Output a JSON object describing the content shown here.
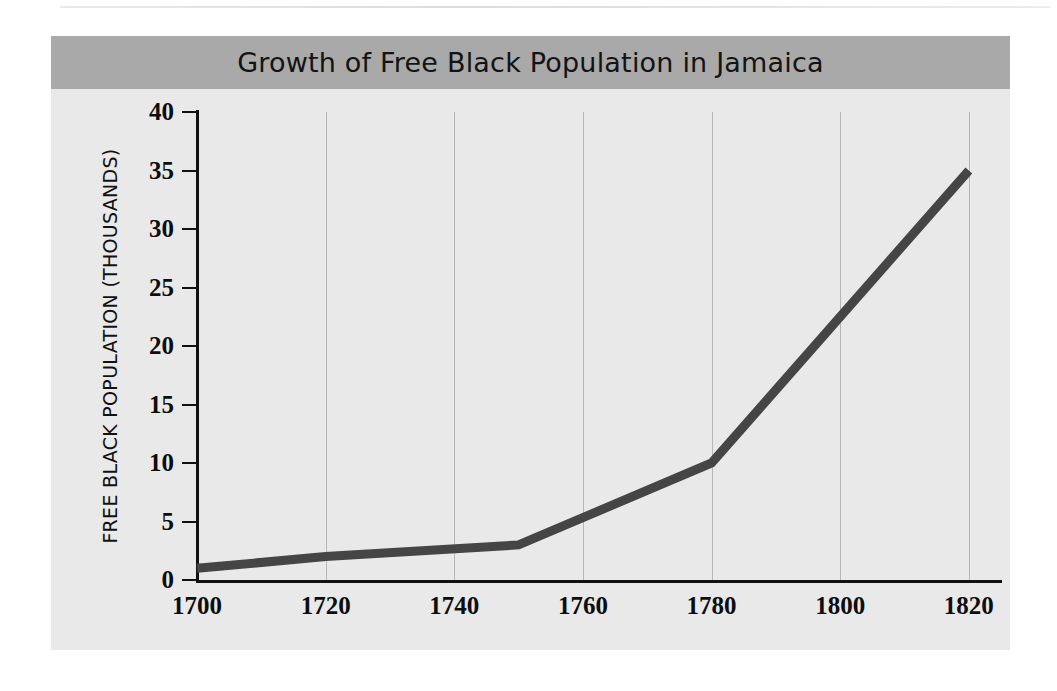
{
  "page": {
    "background_color": "#ffffff",
    "rule_color": "#e0e0e0"
  },
  "figure": {
    "background_color": "#e9e9e9",
    "banner_color": "#a9a9a9",
    "line_color": "#454545",
    "grid_color": "#b6b6b6",
    "axis_color": "#111111"
  },
  "chart_data": {
    "type": "line",
    "title": "Growth of Free Black Population in Jamaica",
    "xlabel": "",
    "ylabel": "FREE BLACK POPULATION (THOUSANDS)",
    "x": [
      1700,
      1720,
      1750,
      1780,
      1820
    ],
    "values": [
      1,
      2,
      3,
      10,
      35
    ],
    "series": [
      {
        "name": "Free Black Population",
        "points": [
          {
            "x": 1700,
            "y": 1
          },
          {
            "x": 1720,
            "y": 2
          },
          {
            "x": 1750,
            "y": 3
          },
          {
            "x": 1780,
            "y": 10
          },
          {
            "x": 1820,
            "y": 35
          }
        ]
      }
    ],
    "xlim": [
      1700,
      1825
    ],
    "ylim": [
      0,
      40
    ],
    "xticks": [
      1700,
      1720,
      1740,
      1760,
      1780,
      1800,
      1820
    ],
    "xtick_labels": [
      "1700",
      "1720",
      "1740",
      "1760",
      "1780",
      "1800",
      "1820"
    ],
    "yticks": [
      0,
      5,
      10,
      15,
      20,
      25,
      30,
      35,
      40
    ],
    "ytick_labels": [
      "0",
      "5",
      "10",
      "15",
      "20",
      "25",
      "30",
      "35",
      "40"
    ],
    "grid": "vertical-only",
    "gridlines_x": [
      1720,
      1740,
      1760,
      1780,
      1800,
      1820
    ],
    "legend": null,
    "line_width_px": 9
  }
}
